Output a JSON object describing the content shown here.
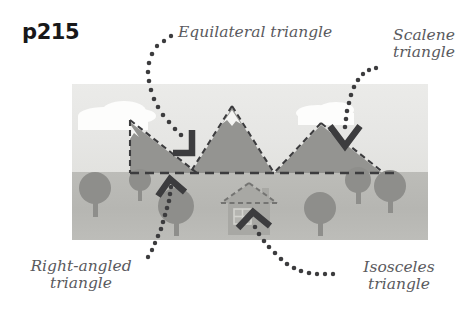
{
  "page": {
    "code_label": "p215",
    "background_color": "#ffffff"
  },
  "callouts": [
    {
      "key": "equilateral",
      "text": "Equilateral triangle",
      "lines": [
        "Equilateral triangle"
      ],
      "position": "top-center",
      "points_to": "center-mountain"
    },
    {
      "key": "scalene",
      "text": "Scalene\ntriangle",
      "lines": [
        "Scalene",
        "triangle"
      ],
      "position": "top-right",
      "points_to": "right-mountain"
    },
    {
      "key": "right_angled",
      "text": "Right-angled\ntriangle",
      "lines": [
        "Right-angled",
        "triangle"
      ],
      "position": "bottom-left",
      "points_to": "left-mountain"
    },
    {
      "key": "isosceles",
      "text": "Isosceles\ntriangle",
      "lines": [
        "Isosceles",
        "triangle"
      ],
      "position": "bottom-right",
      "points_to": "house-roof"
    }
  ],
  "illustration": {
    "panel": {
      "x": 72,
      "y": 84,
      "width": 356,
      "height": 156,
      "sky_color": "#e8e8e6",
      "ground_color": "#b9b9b5",
      "horizon_y": 172
    },
    "clouds": [
      {
        "name": "cloud-left",
        "cx": 118,
        "cy": 110,
        "color": "#fdfdfc"
      },
      {
        "name": "cloud-right",
        "cx": 323,
        "cy": 109,
        "color": "#fdfdfc"
      }
    ],
    "mountains": [
      {
        "name": "left-mountain",
        "shape": "right-angled-triangle",
        "fill": "#949491",
        "apex": [
          130,
          122
        ],
        "base_left": [
          130,
          173
        ],
        "base_right": [
          196,
          173
        ],
        "dashed_edges": [
          "left",
          "base",
          "hypotenuse"
        ],
        "snow_cap": true
      },
      {
        "name": "center-mountain",
        "shape": "equilateral-triangle",
        "fill": "#949491",
        "apex": [
          232,
          108
        ],
        "base_left": [
          191,
          173
        ],
        "base_right": [
          273,
          173
        ],
        "dashed_edges": [
          "left",
          "right",
          "base"
        ],
        "snow_cap": true
      },
      {
        "name": "right-mountain",
        "shape": "scalene-triangle",
        "fill": "#949491",
        "apex": [
          321,
          125
        ],
        "base_left": [
          275,
          173
        ],
        "base_right": [
          382,
          173
        ],
        "dashed_edges": [
          "left",
          "right",
          "base"
        ],
        "snow_cap": false
      }
    ],
    "baseline": {
      "name": "horizon-dashed-line",
      "y": 173,
      "x_start": 130,
      "x_end": 400,
      "color": "#3c3c3e",
      "style": "dashed"
    },
    "house": {
      "name": "house",
      "body": {
        "x": 228,
        "y": 202,
        "width": 42,
        "height": 32,
        "fill": "#a8a8a4"
      },
      "roof": {
        "apex": [
          249,
          183
        ],
        "left": [
          222,
          203
        ],
        "right": [
          276,
          203
        ],
        "style": "dashed",
        "shape": "isosceles-triangle"
      },
      "chimney": {
        "x": 262,
        "y": 189,
        "width": 7,
        "height": 13
      },
      "window": {
        "x": 234,
        "y": 209,
        "width": 16,
        "height": 14
      }
    },
    "trees": [
      {
        "name": "tree-1",
        "cx": 95,
        "cy": 188,
        "r": 16
      },
      {
        "name": "tree-2",
        "cx": 140,
        "cy": 180,
        "r": 11
      },
      {
        "name": "tree-3",
        "cx": 176,
        "cy": 206,
        "r": 18
      },
      {
        "name": "tree-4",
        "cx": 320,
        "cy": 208,
        "r": 16
      },
      {
        "name": "tree-5",
        "cx": 358,
        "cy": 180,
        "r": 13
      },
      {
        "name": "tree-6",
        "cx": 390,
        "cy": 186,
        "r": 16
      }
    ],
    "tree_color": "#8e8e8b",
    "arrows": [
      {
        "name": "arrow-equilateral",
        "style": "chevron",
        "direction": "down-right",
        "tip": [
          196,
          156
        ],
        "color": "#3c3c3e"
      },
      {
        "name": "arrow-scalene",
        "style": "chevron",
        "direction": "down",
        "tip": [
          345,
          146
        ],
        "color": "#3c3c3e"
      },
      {
        "name": "arrow-right-angled",
        "style": "chevron",
        "direction": "up",
        "tip": [
          172,
          180
        ],
        "color": "#3c3c3e"
      },
      {
        "name": "arrow-isosceles",
        "style": "chevron",
        "direction": "up",
        "tip": [
          253,
          215
        ],
        "color": "#3c3c3e"
      }
    ],
    "leader_dots": {
      "color": "#3c3c3e",
      "radius": 2.3,
      "description": "dotted curved leader lines connecting each label to its arrow"
    }
  },
  "colors": {
    "text": "#5a5a5e",
    "code_text": "#18181a",
    "ink": "#3c3c3e",
    "sky": "#e8e8e6",
    "ground": "#b9b9b5",
    "mountain": "#949491",
    "tree": "#8e8e8b"
  }
}
